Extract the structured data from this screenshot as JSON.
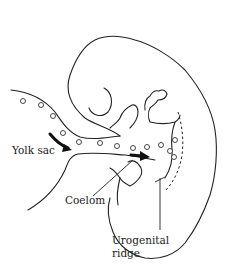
{
  "diagram": {
    "labels": {
      "yolk_sac": "Yolk sac",
      "coelom": "Coelom",
      "urogenital_line1": "Urogenital",
      "urogenital_line2": "ridge"
    },
    "colors": {
      "stroke": "#222222",
      "background": "#ffffff",
      "arrow": "#111111"
    },
    "elements": [
      "embryo-outline",
      "head-fold",
      "limb-bud",
      "yolk-sac-stalk",
      "germ-cell-circles",
      "migration-arrows",
      "urogenital-ridge-dashed-line",
      "leader-lines"
    ]
  }
}
